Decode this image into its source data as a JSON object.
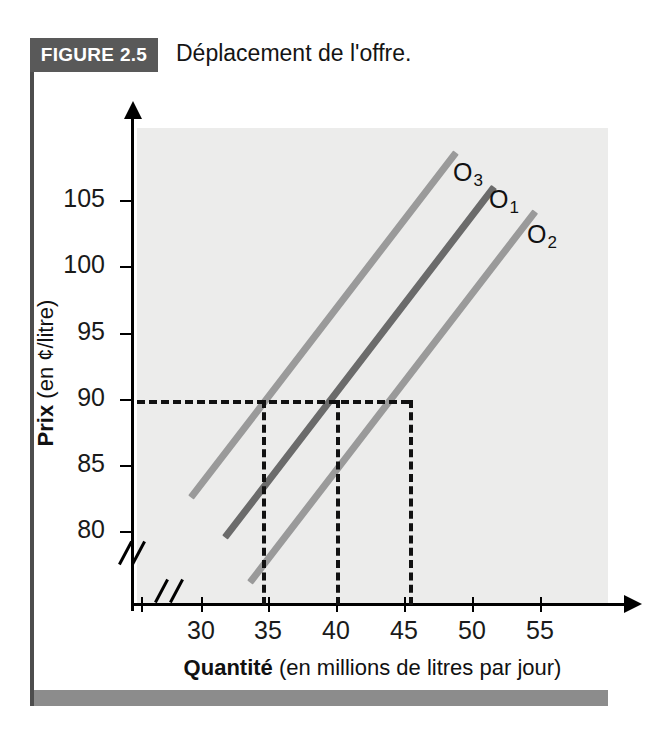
{
  "header": {
    "figure_label": "FIGURE 2.5",
    "title": "Déplacement de l'offre."
  },
  "colors": {
    "banner_bg": "#595959",
    "bottom_bar": "#8c8c8c",
    "plot_bg": "#ececeb",
    "curve_o1": "#6b6b6b",
    "curve_o2": "#9a9a9a",
    "curve_o3": "#9a9a9a",
    "axis": "#000000",
    "dash": "#111111"
  },
  "chart_data": {
    "type": "line",
    "title": "Déplacement de l'offre.",
    "xlabel_strong": "Quantité",
    "xlabel_rest": " (en millions de litres par jour)",
    "ylabel_strong": "Prix",
    "ylabel_rest": " (en ¢/litre)",
    "xlim": [
      26.5,
      58.5
    ],
    "ylim": [
      76,
      108.5
    ],
    "xticks": [
      30,
      35,
      40,
      45,
      50,
      55
    ],
    "yticks": [
      80,
      85,
      90,
      95,
      100,
      105
    ],
    "xtick_labels": [
      "30",
      "35",
      "40",
      "45",
      "50",
      "55"
    ],
    "ytick_labels": [
      "80",
      "85",
      "90",
      "95",
      "100",
      "105"
    ],
    "grid": false,
    "axis_break_x": true,
    "axis_break_y": true,
    "legend": "inline-labels",
    "series": [
      {
        "name": "O3",
        "label": "O",
        "subscript": "3",
        "color": "#9a9a9a",
        "x": [
          30.2,
          48.2
        ],
        "y": [
          83.3,
          106.8
        ],
        "reference_point": {
          "q": 35,
          "p": 90
        }
      },
      {
        "name": "O1",
        "label": "O",
        "subscript": "1",
        "color": "#6b6b6b",
        "x": [
          32.5,
          50.8
        ],
        "y": [
          80.6,
          104.5
        ],
        "reference_point": {
          "q": 40,
          "p": 90
        }
      },
      {
        "name": "O2",
        "label": "O",
        "subscript": "2",
        "color": "#9a9a9a",
        "x": [
          34.2,
          53.6
        ],
        "y": [
          77.5,
          102.8
        ],
        "reference_point": {
          "q": 45,
          "p": 90
        }
      }
    ],
    "annotations": {
      "price_line": {
        "p": 90,
        "style": "dashed",
        "from_q": 26.5,
        "to_q": 45
      },
      "quantity_lines": [
        {
          "q": 35,
          "style": "dashed",
          "from_p": 76,
          "to_p": 90
        },
        {
          "q": 40,
          "style": "dashed",
          "from_p": 76,
          "to_p": 90
        },
        {
          "q": 45,
          "style": "dashed",
          "from_p": 76,
          "to_p": 90
        }
      ]
    },
    "curve_labels": [
      {
        "text": "O",
        "sub": "3",
        "x_px": 453,
        "y_px": 158
      },
      {
        "text": "O",
        "sub": "1",
        "x_px": 489,
        "y_px": 185
      },
      {
        "text": "O",
        "sub": "2",
        "x_px": 527,
        "y_px": 220
      }
    ]
  }
}
